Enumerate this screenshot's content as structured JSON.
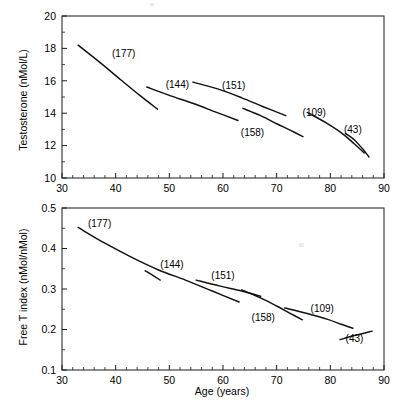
{
  "figure": {
    "background": "#ffffff",
    "ink": "#111111",
    "width": 399,
    "height": 406
  },
  "axis": {
    "x_label": "Age (years)",
    "x_ticks": [
      "30",
      "40",
      "50",
      "60",
      "70",
      "80",
      "90"
    ],
    "x_min": 30,
    "x_max": 90,
    "x_minor_step": 2,
    "top_y_label": "Testosterone (nMol/L)",
    "top_y_ticks": [
      "20",
      "18",
      "16",
      "14",
      "12",
      "10"
    ],
    "bottom_y_label": "Free T index (nMol/nMol)",
    "bottom_y_ticks": [
      "0.5",
      "0.4",
      "0.3",
      "0.2",
      "0.1"
    ]
  },
  "chart_data": [
    {
      "type": "line",
      "panel": "top",
      "title": "",
      "xlabel": "Age (years)",
      "ylabel": "Testosterone (nMol/L)",
      "xlim": [
        30,
        90
      ],
      "ylim": [
        10,
        20
      ],
      "xticks": [
        30,
        40,
        50,
        60,
        70,
        80,
        90
      ],
      "yticks": [
        10,
        12,
        14,
        16,
        18,
        20
      ],
      "grid": false,
      "legend": "none",
      "annotations": [
        "(177)",
        "(144)",
        "(151)",
        "(158)",
        "(109)",
        "(43)"
      ],
      "series": [
        {
          "name": "(177)",
          "n": 177,
          "label_x": 41.5,
          "label_y": 17.45,
          "x": [
            33.0,
            37.0,
            41.0,
            44.5,
            47.8
          ],
          "y": [
            18.2,
            17.15,
            16.05,
            15.1,
            14.25
          ]
        },
        {
          "name": "(144)",
          "n": 144,
          "label_x": 51.5,
          "label_y": 15.55,
          "x": [
            45.8,
            50.0,
            54.5,
            58.8,
            62.8
          ],
          "y": [
            15.62,
            15.1,
            14.6,
            14.05,
            13.55
          ]
        },
        {
          "name": "(151)",
          "n": 151,
          "label_x": 62.0,
          "label_y": 15.5,
          "x": [
            54.4,
            59.0,
            63.5,
            67.5,
            71.7
          ],
          "y": [
            15.92,
            15.5,
            14.95,
            14.4,
            13.85
          ]
        },
        {
          "name": "(158)",
          "n": 158,
          "label_x": 65.5,
          "label_y": 12.6,
          "x": [
            63.7,
            67.0,
            70.0,
            72.5,
            74.9
          ],
          "y": [
            14.3,
            13.85,
            13.35,
            12.95,
            12.55
          ]
        },
        {
          "name": "(109)",
          "n": 109,
          "label_x": 77.0,
          "label_y": 13.8,
          "x": [
            75.7,
            79.0,
            82.0,
            84.5,
            86.3
          ],
          "y": [
            14.05,
            13.45,
            12.8,
            12.1,
            11.55
          ]
        },
        {
          "name": "(43)",
          "n": 43,
          "label_x": 84.2,
          "label_y": 12.75,
          "x": [
            82.8,
            84.5,
            86.0,
            87.2
          ],
          "y": [
            12.75,
            12.35,
            11.8,
            11.3
          ]
        }
      ]
    },
    {
      "type": "line",
      "panel": "bottom",
      "title": "",
      "xlabel": "Age (years)",
      "ylabel": "Free T index (nMol/nMol)",
      "xlim": [
        30,
        90
      ],
      "ylim": [
        0.1,
        0.5
      ],
      "xticks": [
        30,
        40,
        50,
        60,
        70,
        80,
        90
      ],
      "yticks": [
        0.1,
        0.2,
        0.3,
        0.4,
        0.5
      ],
      "grid": false,
      "legend": "none",
      "annotations": [
        "(177)",
        "(144)",
        "(151)",
        "(158)",
        "(109)",
        "(43)"
      ],
      "series": [
        {
          "name": "(177)",
          "n": 177,
          "label_x": 37.0,
          "label_y": 0.452,
          "x": [
            33.0,
            38.0,
            43.0,
            48.0,
            53.0,
            58.0,
            63.0
          ],
          "y": [
            0.452,
            0.413,
            0.378,
            0.347,
            0.322,
            0.295,
            0.268
          ]
        },
        {
          "name": "(144)",
          "n": 144,
          "label_x": 50.5,
          "label_y": 0.352,
          "x": [
            45.5,
            47.0,
            48.3
          ],
          "y": [
            0.345,
            0.333,
            0.322
          ]
        },
        {
          "name": "(151)",
          "n": 151,
          "label_x": 60.0,
          "label_y": 0.325,
          "x": [
            55.0,
            59.5,
            63.5,
            67.0
          ],
          "y": [
            0.322,
            0.307,
            0.295,
            0.282
          ]
        },
        {
          "name": "(158)",
          "n": 158,
          "label_x": 67.5,
          "label_y": 0.222,
          "x": [
            63.5,
            67.0,
            70.0,
            72.5,
            74.8
          ],
          "y": [
            0.298,
            0.278,
            0.258,
            0.24,
            0.224
          ]
        },
        {
          "name": "(109)",
          "n": 109,
          "label_x": 78.5,
          "label_y": 0.243,
          "x": [
            71.5,
            75.5,
            79.5,
            82.0,
            84.2
          ],
          "y": [
            0.253,
            0.24,
            0.225,
            0.213,
            0.203
          ]
        },
        {
          "name": "(43)",
          "n": 43,
          "label_x": 84.5,
          "label_y": 0.168,
          "x": [
            81.8,
            84.5,
            87.8
          ],
          "y": [
            0.175,
            0.185,
            0.196
          ]
        }
      ]
    }
  ]
}
